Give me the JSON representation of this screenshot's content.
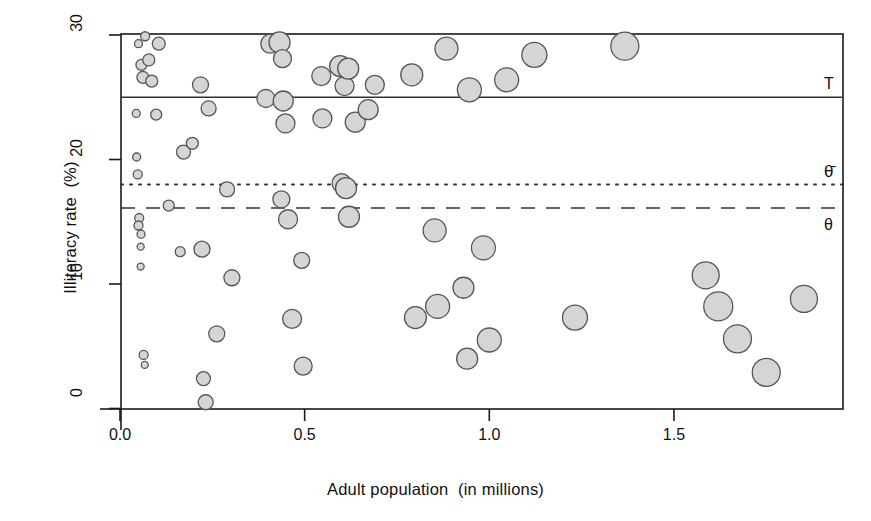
{
  "figure": {
    "width": 871,
    "height": 521,
    "background": "#ffffff"
  },
  "axes": {
    "x_title": "Adult population  (in millions)",
    "y_title": "Illiteracy rate  (%)",
    "x_ticks": [
      "0.0",
      "0.5",
      "1.0",
      "1.5"
    ],
    "y_ticks": [
      "0",
      "10",
      "20",
      "30"
    ]
  },
  "reference_lines": {
    "T": {
      "label": "T",
      "value": 25.0,
      "style": "solid"
    },
    "theta_bar": {
      "label": "θ̄",
      "value": 18.0,
      "style": "dotted"
    },
    "theta": {
      "label": "θ",
      "value": 16.1,
      "style": "dashed"
    }
  },
  "style": {
    "bubble_fill": "#d5d5d5",
    "bubble_stroke": "#555555",
    "axis_color": "#1a1a1a",
    "line_color": "#333333"
  },
  "chart_data": {
    "type": "scatter",
    "title": "",
    "xlabel": "Adult population  (in millions)",
    "ylabel": "Illiteracy rate  (%)",
    "xlim": [
      0.0,
      1.955
    ],
    "ylim": [
      0.0,
      30.1
    ],
    "grid": false,
    "legend": null,
    "size_encoding": "bubble radius proportional to survey weight",
    "reference_lines": [
      {
        "name": "T",
        "y": 25.0,
        "style": "solid"
      },
      {
        "name": "theta_bar",
        "y": 18.0,
        "style": "dotted"
      },
      {
        "name": "theta",
        "y": 16.1,
        "style": "dashed"
      }
    ],
    "points": [
      {
        "x": 0.05,
        "y": 29.3,
        "r": 4.0
      },
      {
        "x": 0.068,
        "y": 29.9,
        "r": 4.5
      },
      {
        "x": 0.105,
        "y": 29.3,
        "r": 6.5
      },
      {
        "x": 0.058,
        "y": 27.6,
        "r": 5.5
      },
      {
        "x": 0.078,
        "y": 28.0,
        "r": 6.0
      },
      {
        "x": 0.062,
        "y": 26.6,
        "r": 6.0
      },
      {
        "x": 0.086,
        "y": 26.3,
        "r": 6.0
      },
      {
        "x": 0.044,
        "y": 23.7,
        "r": 4.0
      },
      {
        "x": 0.098,
        "y": 23.6,
        "r": 5.5
      },
      {
        "x": 0.045,
        "y": 20.2,
        "r": 4.0
      },
      {
        "x": 0.172,
        "y": 20.6,
        "r": 7.0
      },
      {
        "x": 0.048,
        "y": 18.8,
        "r": 4.5
      },
      {
        "x": 0.052,
        "y": 15.3,
        "r": 4.5
      },
      {
        "x": 0.05,
        "y": 14.7,
        "r": 4.5
      },
      {
        "x": 0.057,
        "y": 14.0,
        "r": 4.0
      },
      {
        "x": 0.056,
        "y": 13.0,
        "r": 3.5
      },
      {
        "x": 0.056,
        "y": 11.4,
        "r": 3.5
      },
      {
        "x": 0.064,
        "y": 4.3,
        "r": 4.5
      },
      {
        "x": 0.067,
        "y": 3.5,
        "r": 3.5
      },
      {
        "x": 0.132,
        "y": 16.3,
        "r": 5.5
      },
      {
        "x": 0.163,
        "y": 12.6,
        "r": 5.0
      },
      {
        "x": 0.196,
        "y": 21.3,
        "r": 6.0
      },
      {
        "x": 0.218,
        "y": 26.0,
        "r": 8.0
      },
      {
        "x": 0.222,
        "y": 12.8,
        "r": 8.0
      },
      {
        "x": 0.226,
        "y": 2.4,
        "r": 7.0
      },
      {
        "x": 0.232,
        "y": 0.5,
        "r": 7.5
      },
      {
        "x": 0.24,
        "y": 24.1,
        "r": 7.5
      },
      {
        "x": 0.262,
        "y": 6.0,
        "r": 8.0
      },
      {
        "x": 0.29,
        "y": 17.6,
        "r": 7.5
      },
      {
        "x": 0.303,
        "y": 10.5,
        "r": 8.0
      },
      {
        "x": 0.395,
        "y": 24.9,
        "r": 9.0
      },
      {
        "x": 0.407,
        "y": 29.3,
        "r": 9.5
      },
      {
        "x": 0.432,
        "y": 29.4,
        "r": 10.5
      },
      {
        "x": 0.437,
        "y": 16.8,
        "r": 8.5
      },
      {
        "x": 0.44,
        "y": 28.1,
        "r": 9.0
      },
      {
        "x": 0.442,
        "y": 24.7,
        "r": 10.0
      },
      {
        "x": 0.448,
        "y": 22.9,
        "r": 9.5
      },
      {
        "x": 0.455,
        "y": 15.2,
        "r": 9.5
      },
      {
        "x": 0.466,
        "y": 7.2,
        "r": 9.5
      },
      {
        "x": 0.492,
        "y": 11.9,
        "r": 8.0
      },
      {
        "x": 0.496,
        "y": 3.4,
        "r": 9.0
      },
      {
        "x": 0.545,
        "y": 26.7,
        "r": 9.5
      },
      {
        "x": 0.548,
        "y": 23.3,
        "r": 9.5
      },
      {
        "x": 0.596,
        "y": 27.5,
        "r": 10.5
      },
      {
        "x": 0.6,
        "y": 18.1,
        "r": 9.5
      },
      {
        "x": 0.608,
        "y": 25.9,
        "r": 9.5
      },
      {
        "x": 0.612,
        "y": 17.7,
        "r": 10.5
      },
      {
        "x": 0.618,
        "y": 27.3,
        "r": 10.5
      },
      {
        "x": 0.62,
        "y": 15.4,
        "r": 10.5
      },
      {
        "x": 0.637,
        "y": 23.0,
        "r": 10.0
      },
      {
        "x": 0.672,
        "y": 24.0,
        "r": 10.0
      },
      {
        "x": 0.69,
        "y": 26.0,
        "r": 9.5
      },
      {
        "x": 0.79,
        "y": 26.8,
        "r": 11.0
      },
      {
        "x": 0.8,
        "y": 7.3,
        "r": 11.0
      },
      {
        "x": 0.852,
        "y": 14.3,
        "r": 11.5
      },
      {
        "x": 0.86,
        "y": 8.2,
        "r": 12.0
      },
      {
        "x": 0.884,
        "y": 28.9,
        "r": 11.5
      },
      {
        "x": 0.93,
        "y": 9.7,
        "r": 10.5
      },
      {
        "x": 0.94,
        "y": 4.0,
        "r": 10.5
      },
      {
        "x": 0.946,
        "y": 25.6,
        "r": 12.0
      },
      {
        "x": 0.984,
        "y": 12.9,
        "r": 12.0
      },
      {
        "x": 1.0,
        "y": 5.5,
        "r": 12.0
      },
      {
        "x": 1.047,
        "y": 26.4,
        "r": 12.0
      },
      {
        "x": 1.122,
        "y": 28.4,
        "r": 12.5
      },
      {
        "x": 1.232,
        "y": 7.3,
        "r": 12.5
      },
      {
        "x": 1.367,
        "y": 29.1,
        "r": 14.0
      },
      {
        "x": 1.586,
        "y": 10.7,
        "r": 13.5
      },
      {
        "x": 1.62,
        "y": 8.2,
        "r": 14.5
      },
      {
        "x": 1.672,
        "y": 5.6,
        "r": 14.0
      },
      {
        "x": 1.75,
        "y": 2.9,
        "r": 14.0
      },
      {
        "x": 1.852,
        "y": 8.8,
        "r": 13.5
      }
    ]
  }
}
